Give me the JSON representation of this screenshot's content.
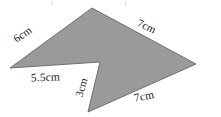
{
  "figure": {
    "kind": "concave-polygon-diagram",
    "shape_name": "arrowhead-polygon",
    "fill_color": "#9a9a9a",
    "outline_color": "#6f6f6f",
    "background_color": "#ffffff",
    "text_color": "#1a1a1a",
    "canvas": {
      "width": 221,
      "height": 117
    },
    "polygon_points": "92,8 10,68 100,62 88,112 196,64",
    "vertices": [
      {
        "name": "top-apex",
        "x": 92,
        "y": 8
      },
      {
        "name": "left-point",
        "x": 10,
        "y": 68
      },
      {
        "name": "notch-reflex",
        "x": 100,
        "y": 62
      },
      {
        "name": "bottom-point",
        "x": 88,
        "y": 112
      },
      {
        "name": "right-point",
        "x": 196,
        "y": 64
      }
    ],
    "labels": {
      "upper_left": "6cm",
      "lower_left": "5.5cm",
      "notch": "3cm",
      "upper_right": "7cm",
      "lower_right": "7cm"
    },
    "artifacts": {
      "speck_left": "scan-speck",
      "speck_right": "scan-speck"
    }
  }
}
